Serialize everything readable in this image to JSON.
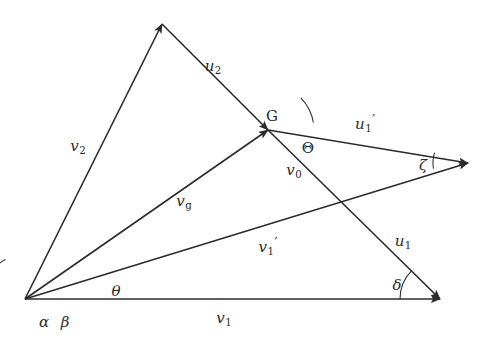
{
  "figure": {
    "type": "vector-velocity-diagram",
    "background_color": "#ffffff",
    "stroke_color": "#2b2b2b",
    "width": 488,
    "height": 345,
    "origin_label": "O",
    "points": {
      "origin": [
        25,
        299
      ],
      "v2_tip": [
        162,
        24
      ],
      "g_node": [
        268,
        130
      ],
      "u1p_tip": [
        468,
        163
      ],
      "v1_tip": [
        440,
        299
      ]
    },
    "vectors": [
      {
        "id": "v2",
        "label": "v",
        "sub": "2",
        "prime": false,
        "from": [
          25,
          299
        ],
        "to": [
          162,
          24
        ],
        "label_pos": [
          78,
          148
        ]
      },
      {
        "id": "u2",
        "label": "u",
        "sub": "2",
        "prime": false,
        "from": [
          162,
          24
        ],
        "to": [
          268,
          130
        ],
        "label_pos": [
          213,
          68
        ]
      },
      {
        "id": "vg",
        "label": "v",
        "sub": "g",
        "prime": false,
        "from": [
          25,
          299
        ],
        "to": [
          268,
          130
        ],
        "label_pos": [
          184,
          203
        ]
      },
      {
        "id": "u1p",
        "label": "u",
        "sub": "1",
        "prime": true,
        "from": [
          268,
          130
        ],
        "to": [
          468,
          163
        ],
        "label_pos": [
          365,
          124
        ]
      },
      {
        "id": "v1p",
        "label": "v",
        "sub": "1",
        "prime": true,
        "from": [
          25,
          299
        ],
        "to": [
          468,
          163
        ],
        "label_pos": [
          268,
          247
        ]
      },
      {
        "id": "v0",
        "label": "v",
        "sub": "0",
        "prime": false,
        "from": [
          268,
          130
        ],
        "to": [
          440,
          299
        ],
        "label_pos": [
          294,
          172
        ]
      },
      {
        "id": "u1",
        "label": "u",
        "sub": "1",
        "prime": false,
        "from": [
          268,
          130
        ],
        "to": [
          440,
          299
        ],
        "label_pos": [
          403,
          243
        ]
      },
      {
        "id": "v1",
        "label": "v",
        "sub": "1",
        "prime": false,
        "from": [
          25,
          299
        ],
        "to": [
          440,
          299
        ],
        "label_pos": [
          224,
          320
        ]
      }
    ],
    "angle_labels": [
      {
        "id": "alpha",
        "text": "α",
        "pos": [
          44,
          322
        ]
      },
      {
        "id": "beta",
        "text": "β",
        "pos": [
          65,
          322
        ]
      },
      {
        "id": "theta",
        "text": "θ",
        "pos": [
          116,
          291
        ]
      },
      {
        "id": "Theta",
        "text": "Θ",
        "pos": [
          308,
          148
        ]
      },
      {
        "id": "zeta",
        "text": "ζ",
        "pos": [
          423,
          165
        ]
      },
      {
        "id": "delta",
        "text": "δ",
        "pos": [
          397,
          285
        ]
      }
    ],
    "point_labels": [
      {
        "id": "G",
        "text": "G",
        "pos": [
          272,
          116
        ]
      }
    ],
    "angle_arcs": [
      {
        "id": "arc-alpha",
        "vertex": [
          25,
          299
        ],
        "radius": 44,
        "start_deg": 180,
        "end_deg": 116.4
      },
      {
        "id": "arc-beta",
        "vertex": [
          25,
          299
        ],
        "radius": 58,
        "start_deg": 180,
        "end_deg": 145.2
      },
      {
        "id": "arc-theta",
        "vertex": [
          25,
          299
        ],
        "radius": 97,
        "start_deg": 180,
        "end_deg": 162.9
      },
      {
        "id": "arc-Theta",
        "vertex": [
          268,
          130
        ],
        "radius": 46,
        "start_deg": 9.4,
        "end_deg": 44.5
      },
      {
        "id": "arc-zeta",
        "vertex": [
          468,
          163
        ],
        "radius": 35,
        "start_deg": 189.4,
        "end_deg": 162.9
      },
      {
        "id": "arc-delta",
        "vertex": [
          440,
          299
        ],
        "radius": 40,
        "start_deg": 180,
        "end_deg": 135.5
      }
    ]
  }
}
